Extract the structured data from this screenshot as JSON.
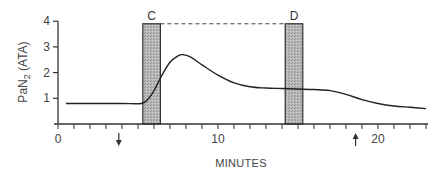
{
  "chart_data": {
    "type": "line",
    "title": "",
    "xlabel": "MINUTES",
    "ylabel": "PaN2 (ATA)",
    "ylabel_main": "PaN",
    "ylabel_sub": "2",
    "ylabel_unit": " (ATA)",
    "xlim": [
      0,
      23
    ],
    "ylim": [
      0,
      4
    ],
    "x_ticks": [
      0,
      10,
      20
    ],
    "x_tick_labels": [
      "0",
      "10",
      "20"
    ],
    "y_ticks": [
      1,
      2,
      3,
      4
    ],
    "y_tick_labels": [
      "1",
      "2",
      "3",
      "4"
    ],
    "minor_x_tick_step": 1,
    "grid": false,
    "legend": null,
    "series": [
      {
        "name": "PaN2",
        "x": [
          0.5,
          2,
          4,
          5.2,
          5.6,
          6.0,
          6.5,
          7.0,
          7.5,
          7.8,
          8.3,
          9.0,
          10.0,
          11.0,
          12.0,
          13.0,
          14.0,
          15.0,
          16.0,
          17.0,
          18.0,
          19.0,
          20.0,
          21.0,
          22.0,
          23.0
        ],
        "y": [
          0.8,
          0.8,
          0.8,
          0.8,
          0.95,
          1.3,
          1.9,
          2.4,
          2.65,
          2.7,
          2.6,
          2.3,
          1.9,
          1.6,
          1.45,
          1.4,
          1.38,
          1.36,
          1.34,
          1.3,
          1.15,
          0.95,
          0.8,
          0.7,
          0.65,
          0.6
        ]
      }
    ],
    "shaded_bars": [
      {
        "label": "C",
        "x_start": 5.3,
        "x_end": 6.4,
        "y_top": 3.9
      },
      {
        "label": "D",
        "x_start": 14.2,
        "x_end": 15.3,
        "y_top": 3.9
      }
    ],
    "annotations": [
      {
        "type": "dashed-line",
        "from": "C",
        "to": "D",
        "y": 3.9
      },
      {
        "type": "arrow-down",
        "x": 3.8,
        "label": ""
      },
      {
        "type": "arrow-up",
        "x": 18.6,
        "label": ""
      }
    ]
  }
}
